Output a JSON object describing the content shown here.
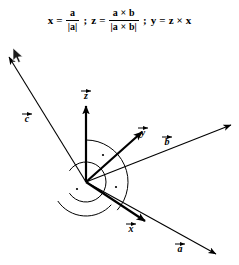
{
  "formula": {
    "x_var": "x",
    "x_equals": "=",
    "x_numerator": "a",
    "x_denominator": "|a|",
    "sep1": ";",
    "z_var": "z",
    "z_equals": "=",
    "z_numerator": "a × b",
    "z_denominator": "|a × b|",
    "sep2": ";",
    "y_var": "y",
    "y_equals": "=",
    "y_expression": "z × x",
    "full_text": "x = a/|a| ; z = (a × b)/|a × b| ; y = z × x"
  },
  "diagram": {
    "stroke_color": "#000000",
    "background_color": "#ffffff",
    "origin": {
      "x": 86,
      "y": 142
    },
    "vectors": [
      {
        "id": "c",
        "label": "c",
        "has_overarrow": true,
        "description": "vector c, upper-left from origin",
        "x1": 86,
        "y1": 142,
        "x2": 9,
        "y2": 17,
        "stroke_width": 1.1,
        "label_x": 27,
        "label_y": 82,
        "label_arrow_dx": 0,
        "label_arrow_dy": -8
      },
      {
        "id": "z",
        "label": "z",
        "has_overarrow": true,
        "description": "unit vector z, straight up from origin",
        "x1": 86,
        "y1": 142,
        "x2": 86,
        "y2": 66,
        "stroke_width": 2.2,
        "label_x": 86,
        "label_y": 59,
        "label_arrow_dx": 0,
        "label_arrow_dy": -8
      },
      {
        "id": "y",
        "label": "y",
        "has_overarrow": true,
        "description": "unit vector y, upper-right from origin",
        "x1": 86,
        "y1": 142,
        "x2": 142,
        "y2": 92,
        "stroke_width": 2.2,
        "label_x": 143,
        "label_y": 96,
        "label_arrow_dx": 0,
        "label_arrow_dy": -8
      },
      {
        "id": "b",
        "label": "b",
        "has_overarrow": true,
        "description": "vector b, long upper-right from origin",
        "x1": 86,
        "y1": 142,
        "x2": 231,
        "y2": 85,
        "stroke_width": 1.1,
        "label_x": 167,
        "label_y": 105,
        "label_arrow_dx": 0,
        "label_arrow_dy": -8
      },
      {
        "id": "x",
        "label": "x",
        "has_overarrow": true,
        "description": "unit vector x, lower-right from origin",
        "x1": 86,
        "y1": 142,
        "x2": 145,
        "y2": 181,
        "stroke_width": 2.2,
        "label_x": 131,
        "label_y": 192,
        "label_arrow_dx": 0,
        "label_arrow_dy": -8
      },
      {
        "id": "a",
        "label": "a",
        "has_overarrow": true,
        "description": "vector a, long lower-right from origin",
        "x1": 86,
        "y1": 142,
        "x2": 216,
        "y2": 214,
        "stroke_width": 1.1,
        "label_x": 180,
        "label_y": 212,
        "label_arrow_dx": 0,
        "label_arrow_dy": -8
      }
    ],
    "right_angle_markers": [
      {
        "id": "angle-z-y",
        "description": "right angle between z and y axes",
        "radius": 42,
        "start_angle_deg": 90,
        "end_angle_deg": 318,
        "dot_x": 103,
        "dot_y": 115
      },
      {
        "id": "angle-y-x",
        "description": "right angle between y and x axes",
        "radius": 34,
        "start_angle_deg": 318,
        "end_angle_deg": 214,
        "dot_x": 116,
        "dy": 0,
        "dot_y": 147
      },
      {
        "id": "angle-z-x",
        "description": "right angle between z and x axes",
        "radius": 20,
        "start_angle_deg": 146,
        "end_angle_deg": 214,
        "dot_x": 77,
        "dot_y": 149
      }
    ]
  },
  "cursor": {
    "visible": true,
    "x": 12,
    "y": 47,
    "kind": "arrow-pointer"
  }
}
